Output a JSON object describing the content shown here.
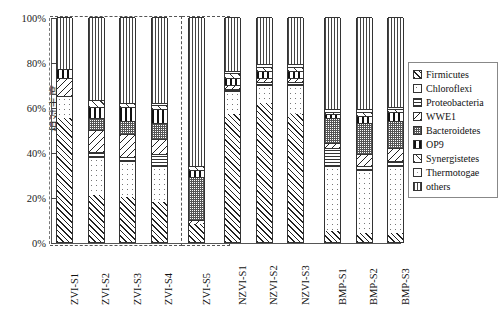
{
  "chart_data": {
    "type": "bar",
    "subtype": "stacked-percentage",
    "title": "",
    "xlabel": "",
    "ylabel": "相对丰度",
    "ylim": [
      0,
      100
    ],
    "yunit": "%",
    "ytick_labels": [
      "0%",
      "20%",
      "40%",
      "60%",
      "80%",
      "100%"
    ],
    "ytick_values": [
      0,
      20,
      40,
      60,
      80,
      100
    ],
    "grid": false,
    "legend_position": "right",
    "categories": [
      "ZVI-S1",
      "ZVI-S2",
      "ZVI-S3",
      "ZVI-S4",
      "ZVI-S5",
      "NZVI-S1",
      "NZVI-S2",
      "NZVI-S3",
      "BMP-S1",
      "BMP-S2",
      "BMP-S3"
    ],
    "groups": [
      {
        "name": "ZVI",
        "members": [
          "ZVI-S1",
          "ZVI-S2",
          "ZVI-S3",
          "ZVI-S4"
        ]
      },
      {
        "name": "ZVI-S5",
        "members": [
          "ZVI-S5"
        ]
      }
    ],
    "series": [
      {
        "name": "Firmicutes",
        "pattern": "diagonal-hatch-dense",
        "values": [
          55,
          21,
          20,
          18,
          8,
          57,
          62,
          57,
          5,
          4,
          4
        ]
      },
      {
        "name": "Chloroflexi",
        "pattern": "light-dots",
        "values": [
          10,
          17,
          16,
          16,
          0,
          10,
          8,
          13,
          29,
          28,
          30
        ]
      },
      {
        "name": "Proteobacteria",
        "pattern": "horizontal-lines",
        "values": [
          0,
          2,
          2,
          5,
          0,
          1,
          1,
          1,
          8,
          2,
          2
        ]
      },
      {
        "name": "WWE1",
        "pattern": "diagonal-backslash",
        "values": [
          8,
          10,
          10,
          7,
          2,
          2,
          2,
          2,
          2,
          5,
          6
        ]
      },
      {
        "name": "Bacteroidetes",
        "pattern": "fine-crosshatch",
        "values": [
          0,
          5,
          6,
          7,
          19,
          0,
          0,
          0,
          11,
          14,
          12
        ]
      },
      {
        "name": "OP9",
        "pattern": "bold-vertical-bars",
        "values": [
          4,
          5,
          6,
          6,
          3,
          3,
          3,
          3,
          2,
          3,
          4
        ]
      },
      {
        "name": "Synergistetes",
        "pattern": "diagonal-slash-sparse",
        "values": [
          0,
          3,
          2,
          2,
          2,
          2,
          2,
          2,
          1,
          2,
          1
        ]
      },
      {
        "name": "Thermotogae",
        "pattern": "very-light-dots",
        "values": [
          0,
          0,
          0,
          1,
          0,
          1,
          1,
          1,
          1,
          1,
          1
        ]
      },
      {
        "name": "others",
        "pattern": "thin-vertical-lines",
        "values": [
          23,
          37,
          38,
          38,
          66,
          24,
          21,
          21,
          41,
          41,
          40
        ]
      }
    ]
  },
  "legend": {
    "items": [
      {
        "label": "Firmicutes"
      },
      {
        "label": "Chloroflexi"
      },
      {
        "label": "Proteobacteria"
      },
      {
        "label": "WWE1"
      },
      {
        "label": "Bacteroidetes"
      },
      {
        "label": "OP9"
      },
      {
        "label": "Synergistetes"
      },
      {
        "label": "Thermotogae"
      },
      {
        "label": "others"
      }
    ]
  }
}
